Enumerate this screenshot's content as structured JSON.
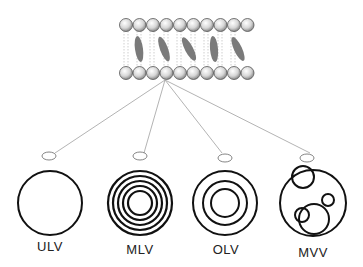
{
  "diagram": {
    "bilayer": {
      "head_count": 10,
      "inclusion_count": 5
    },
    "vesicles": [
      {
        "label": "ULV",
        "name": "unilamellar-vesicle"
      },
      {
        "label": "MLV",
        "name": "multilamellar-vesicle"
      },
      {
        "label": "OLV",
        "name": "oligolamellar-vesicle"
      },
      {
        "label": "MVV",
        "name": "multivesicular-vesicle"
      }
    ],
    "colors": {
      "stroke": "#111111",
      "connector": "#aaaaaa",
      "inclusion": "#7a7a7a"
    }
  }
}
